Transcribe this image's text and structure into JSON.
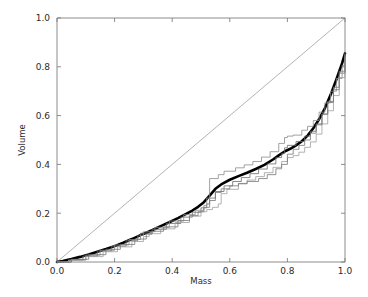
{
  "figure": {
    "background_color": "#ffffff",
    "plot_area": {
      "left": 57,
      "top": 18,
      "right": 345,
      "bottom": 262
    }
  },
  "chart_data": {
    "type": "line",
    "title": "",
    "xlabel": "Mass",
    "ylabel": "Volume",
    "xlim": [
      0.0,
      1.0
    ],
    "ylim": [
      0.0,
      1.0
    ],
    "xticks": [
      0.0,
      0.2,
      0.4,
      0.6,
      0.8,
      1.0
    ],
    "yticks": [
      0.0,
      0.2,
      0.4,
      0.6,
      0.8,
      1.0
    ],
    "xticklabels": [
      "0.0",
      "0.2",
      "0.4",
      "0.6",
      "0.8",
      "1.0"
    ],
    "yticklabels": [
      "0.0",
      "0.2",
      "0.4",
      "0.6",
      "0.8",
      "1.0"
    ],
    "grid": false,
    "legend": false,
    "legend_position": "none",
    "colors": {
      "mean_curve": "#000000",
      "sample_curve_dark": "#555555",
      "sample_curve_mid": "#777777",
      "sample_curve_light": "#999999",
      "reference_line": "#808080",
      "axis": "#808080",
      "text": "#2b2b2b"
    },
    "series": [
      {
        "name": "reference-diagonal",
        "style": "thin-line",
        "color": "#808080",
        "linewidth": 0.6,
        "x": [
          0.0,
          1.0
        ],
        "values": [
          0.0,
          1.0
        ]
      },
      {
        "name": "mean-curve",
        "style": "thick-line",
        "color": "#000000",
        "linewidth": 2.6,
        "x": [
          0.0,
          0.02,
          0.05,
          0.08,
          0.11,
          0.14,
          0.17,
          0.2,
          0.23,
          0.26,
          0.29,
          0.31,
          0.33,
          0.36,
          0.39,
          0.42,
          0.45,
          0.47,
          0.49,
          0.51,
          0.53,
          0.55,
          0.57,
          0.6,
          0.63,
          0.66,
          0.69,
          0.72,
          0.75,
          0.77,
          0.79,
          0.81,
          0.83,
          0.85,
          0.87,
          0.89,
          0.91,
          0.93,
          0.95,
          0.97,
          0.99,
          1.0
        ],
        "values": [
          0.0,
          0.004,
          0.012,
          0.021,
          0.031,
          0.042,
          0.053,
          0.065,
          0.079,
          0.094,
          0.11,
          0.12,
          0.13,
          0.147,
          0.163,
          0.18,
          0.198,
          0.211,
          0.226,
          0.245,
          0.272,
          0.3,
          0.318,
          0.337,
          0.352,
          0.366,
          0.381,
          0.398,
          0.42,
          0.437,
          0.453,
          0.464,
          0.478,
          0.495,
          0.518,
          0.548,
          0.585,
          0.63,
          0.685,
          0.748,
          0.815,
          0.855
        ]
      },
      {
        "name": "sample-curve-1",
        "style": "step-line",
        "color": "#6a6a6a",
        "linewidth": 0.8,
        "x": [
          0.0,
          0.04,
          0.09,
          0.14,
          0.19,
          0.24,
          0.28,
          0.29,
          0.33,
          0.38,
          0.43,
          0.47,
          0.5,
          0.52,
          0.53,
          0.55,
          0.58,
          0.61,
          0.64,
          0.67,
          0.7,
          0.73,
          0.76,
          0.78,
          0.79,
          0.8,
          0.83,
          0.86,
          0.88,
          0.9,
          0.92,
          0.94,
          0.96,
          0.98,
          1.0
        ],
        "values": [
          0.0,
          0.008,
          0.024,
          0.045,
          0.065,
          0.087,
          0.107,
          0.118,
          0.134,
          0.158,
          0.184,
          0.204,
          0.222,
          0.238,
          0.262,
          0.289,
          0.312,
          0.33,
          0.346,
          0.362,
          0.381,
          0.402,
          0.428,
          0.444,
          0.468,
          0.478,
          0.494,
          0.516,
          0.536,
          0.566,
          0.606,
          0.654,
          0.706,
          0.774,
          0.85
        ]
      },
      {
        "name": "sample-curve-2",
        "style": "step-line",
        "color": "#8a8a8a",
        "linewidth": 0.8,
        "x": [
          0.0,
          0.05,
          0.1,
          0.15,
          0.2,
          0.25,
          0.29,
          0.3,
          0.34,
          0.39,
          0.44,
          0.48,
          0.51,
          0.52,
          0.53,
          0.56,
          0.58,
          0.62,
          0.65,
          0.68,
          0.71,
          0.74,
          0.77,
          0.79,
          0.8,
          0.82,
          0.85,
          0.87,
          0.89,
          0.91,
          0.93,
          0.95,
          0.97,
          0.99,
          1.0
        ],
        "values": [
          0.0,
          0.01,
          0.028,
          0.048,
          0.07,
          0.092,
          0.11,
          0.124,
          0.142,
          0.168,
          0.194,
          0.212,
          0.232,
          0.262,
          0.342,
          0.358,
          0.372,
          0.386,
          0.398,
          0.412,
          0.43,
          0.452,
          0.486,
          0.51,
          0.516,
          0.52,
          0.54,
          0.556,
          0.58,
          0.614,
          0.652,
          0.7,
          0.752,
          0.806,
          0.848
        ]
      },
      {
        "name": "sample-curve-3",
        "style": "step-line",
        "color": "#9e9e9e",
        "linewidth": 0.8,
        "x": [
          0.0,
          0.04,
          0.1,
          0.16,
          0.21,
          0.26,
          0.3,
          0.32,
          0.36,
          0.41,
          0.46,
          0.5,
          0.52,
          0.54,
          0.56,
          0.57,
          0.59,
          0.63,
          0.66,
          0.69,
          0.72,
          0.75,
          0.78,
          0.8,
          0.82,
          0.84,
          0.86,
          0.88,
          0.9,
          0.92,
          0.94,
          0.96,
          0.98,
          1.0
        ],
        "values": [
          0.0,
          0.007,
          0.022,
          0.042,
          0.062,
          0.084,
          0.104,
          0.116,
          0.136,
          0.162,
          0.188,
          0.206,
          0.215,
          0.224,
          0.238,
          0.28,
          0.298,
          0.32,
          0.336,
          0.35,
          0.366,
          0.388,
          0.412,
          0.428,
          0.436,
          0.45,
          0.47,
          0.492,
          0.524,
          0.566,
          0.62,
          0.682,
          0.756,
          0.84
        ]
      },
      {
        "name": "sample-curve-4",
        "style": "step-line",
        "color": "#777777",
        "linewidth": 0.8,
        "x": [
          0.0,
          0.05,
          0.11,
          0.17,
          0.22,
          0.27,
          0.31,
          0.33,
          0.37,
          0.42,
          0.46,
          0.49,
          0.51,
          0.53,
          0.55,
          0.57,
          0.6,
          0.63,
          0.66,
          0.7,
          0.73,
          0.76,
          0.78,
          0.8,
          0.82,
          0.84,
          0.86,
          0.88,
          0.9,
          0.92,
          0.94,
          0.96,
          0.98,
          1.0
        ],
        "values": [
          0.0,
          0.011,
          0.03,
          0.052,
          0.072,
          0.094,
          0.114,
          0.126,
          0.144,
          0.17,
          0.19,
          0.206,
          0.224,
          0.252,
          0.285,
          0.3,
          0.312,
          0.322,
          0.33,
          0.342,
          0.358,
          0.382,
          0.4,
          0.442,
          0.462,
          0.478,
          0.5,
          0.528,
          0.562,
          0.606,
          0.658,
          0.716,
          0.782,
          0.86
        ]
      }
    ]
  }
}
